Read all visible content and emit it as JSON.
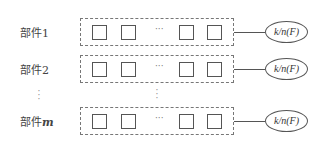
{
  "diagram": {
    "rows": [
      {
        "label": "部件1",
        "label_prefix": "部件",
        "label_index": "1",
        "ellipsis": "···",
        "node": "k/n(F)"
      },
      {
        "label": "部件2",
        "label_prefix": "部件",
        "label_index": "2",
        "ellipsis": "···",
        "node": "k/n(F)"
      },
      {
        "label": "部件m",
        "label_prefix": "部件",
        "label_index": "m",
        "ellipsis": "···",
        "node": "k/n(F)"
      }
    ],
    "vertical_ellipsis": "⋮",
    "colors": {
      "stroke": "#555555",
      "dashed_border": "#777777",
      "background": "#ffffff"
    }
  }
}
